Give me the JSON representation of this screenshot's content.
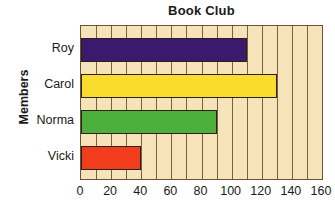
{
  "chart_data": {
    "type": "bar",
    "orientation": "horizontal",
    "title": "Book Club",
    "xlabel": "",
    "ylabel": "Members",
    "categories": [
      "Roy",
      "Carol",
      "Norma",
      "Vicki"
    ],
    "values": [
      110,
      130,
      90,
      40
    ],
    "series": [
      {
        "name": "Books read",
        "values": [
          110,
          130,
          90,
          40
        ]
      }
    ],
    "bar_colors": [
      "#3b1a6e",
      "#f9dc2e",
      "#4caf3c",
      "#f23c1e"
    ],
    "xlim": [
      0,
      160
    ],
    "xticks": [
      0,
      20,
      40,
      60,
      80,
      100,
      120,
      140,
      160
    ],
    "xtick_labels": [
      "0",
      "20",
      "40",
      "60",
      "80",
      "100",
      "120",
      "140",
      "160"
    ],
    "grid": true,
    "grid_interval": 10,
    "legend": false,
    "plot_background": "#f6e3b9",
    "grid_color": "#7a6038",
    "axis_color": "#6b5433",
    "bar_outline_color": "#2a2218",
    "text_color": "#1a1a1a"
  }
}
